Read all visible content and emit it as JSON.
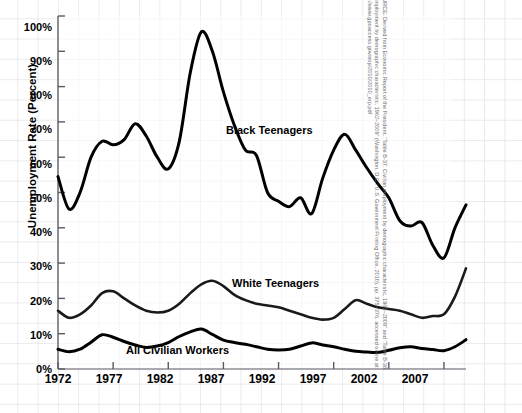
{
  "figure": {
    "ylabel": "Unemployment Rate (Percent)",
    "title_fragment": "",
    "source": "SOURCE: Derived from Economic Report of the President, “Table B-37: Civilian employment by demographic characteristic, 1962–2009” and “Table B-38: Unemployment by demographic characteristic, 1962–2009” (Washington, D.C.: U.S. Government Printing Office, 2010), pp. 375–376, accessed online at http://www.gpoaccess.gov/eop/2010/2010_erp.pdf"
  },
  "annotations": {
    "black_teenagers": "Black Teenagers",
    "white_teenagers": "White Teenagers",
    "all_civilian_workers": "All Civilian Workers"
  },
  "axes": {
    "y_ticks": [
      "100%",
      "90%",
      "80%",
      "70%",
      "60%",
      "50%",
      "40%",
      "30%",
      "20%",
      "10%",
      "0%"
    ],
    "x_ticks": [
      "1972",
      "1977",
      "1982",
      "1987",
      "1992",
      "1997",
      "2002",
      "2007"
    ]
  },
  "chart_data": {
    "type": "line",
    "xlabel": "",
    "ylabel": "Unemployment Rate (Percent)",
    "xlim": [
      1972,
      2009
    ],
    "ylim": [
      0,
      100
    ],
    "grid": true,
    "legend": "inline-labels",
    "x": [
      1972,
      1973,
      1974,
      1975,
      1976,
      1977,
      1978,
      1979,
      1980,
      1981,
      1982,
      1983,
      1984,
      1985,
      1986,
      1987,
      1988,
      1989,
      1990,
      1991,
      1992,
      1993,
      1994,
      1995,
      1996,
      1997,
      1998,
      1999,
      2000,
      2001,
      2002,
      2003,
      2004,
      2005,
      2006,
      2007,
      2008,
      2009
    ],
    "series": [
      {
        "name": "Black Teenagers",
        "color": "#000000",
        "values": [
          54.5,
          45.3,
          50.0,
          60.0,
          64.5,
          63.5,
          65.0,
          69.5,
          66.0,
          60.0,
          56.7,
          64.5,
          84.0,
          95.5,
          90.0,
          78.5,
          69.0,
          62.0,
          60.5,
          50.0,
          47.5,
          46.0,
          48.5,
          44.0,
          54.0,
          62.0,
          66.5,
          62.0,
          57.0,
          52.5,
          48.5,
          42.0,
          40.5,
          41.5,
          35.0,
          31.5,
          40.0,
          46.5
        ]
      },
      {
        "name": "White Teenagers",
        "color": "#1a1a1a",
        "values": [
          16.5,
          14.5,
          15.5,
          18.0,
          21.5,
          22.0,
          20.0,
          18.0,
          16.5,
          16.0,
          16.5,
          18.5,
          21.5,
          24.0,
          25.0,
          23.5,
          21.0,
          19.5,
          18.5,
          18.0,
          17.5,
          16.5,
          15.5,
          14.5,
          14.0,
          14.5,
          17.0,
          19.5,
          18.5,
          17.5,
          17.0,
          16.5,
          15.5,
          14.5,
          15.0,
          15.5,
          20.5,
          28.5
        ]
      },
      {
        "name": "All Civilian Workers",
        "color": "#000000",
        "values": [
          5.6,
          4.9,
          5.6,
          7.6,
          9.7,
          9.0,
          7.8,
          6.8,
          6.1,
          6.5,
          7.5,
          9.2,
          10.5,
          11.3,
          9.8,
          8.2,
          7.5,
          7.0,
          6.3,
          5.6,
          5.4,
          5.6,
          6.5,
          7.4,
          6.8,
          6.3,
          5.6,
          5.0,
          4.8,
          4.7,
          5.3,
          6.0,
          6.3,
          5.8,
          5.5,
          5.2,
          6.3,
          8.3
        ]
      }
    ]
  }
}
